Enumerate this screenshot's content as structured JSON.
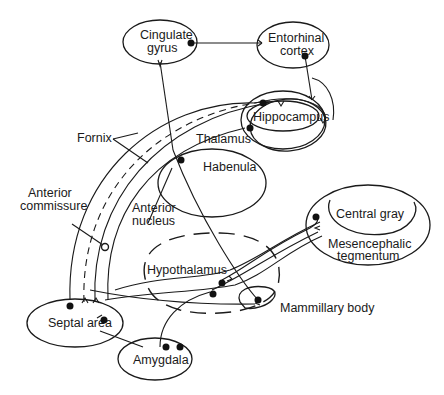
{
  "diagram": {
    "type": "neuroanatomy pathway diagram",
    "structures": {
      "cingulate_gyrus": {
        "line1": "Cingulate",
        "line2": "gyrus"
      },
      "entorhinal_cortex": {
        "line1": "Entorhinal",
        "line2": "cortex"
      },
      "hippocampus": "Hippocampus",
      "thalamus": "Thalamus",
      "habenula": "Habenula",
      "anterior_nucleus": {
        "line1": "Anterior",
        "line2": "nucleus"
      },
      "fornix": "Fornix",
      "anterior_commissure": {
        "line1": "Anterior",
        "line2": "commissure"
      },
      "central_gray": "Central gray",
      "mesencephalic_tegmentum": {
        "line1": "Mesencephalic",
        "line2": "tegmentum"
      },
      "hypothalamus": "Hypothalamus",
      "mammillary_body": "Mammillary body",
      "septal_area": "Septal area",
      "amygdala": "Amygdala"
    },
    "colors": {
      "ink": "#1a1a1a",
      "background": "#ffffff"
    }
  }
}
